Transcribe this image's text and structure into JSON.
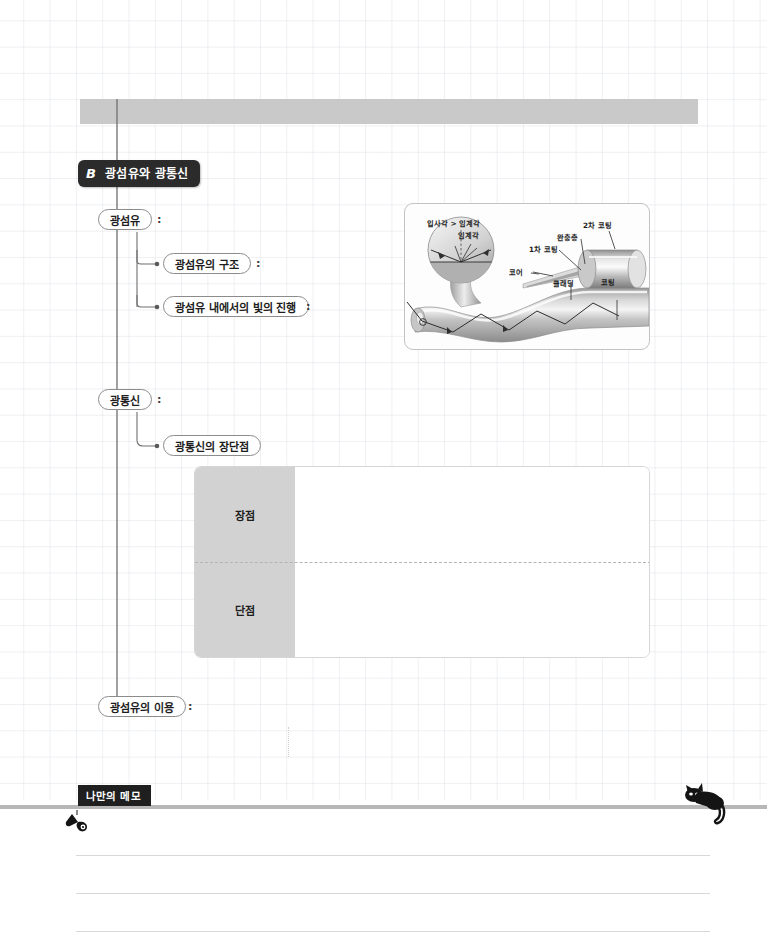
{
  "page": {
    "top_bar_text": "",
    "background": "grid-notebook"
  },
  "section": {
    "letter": "B",
    "title": "광섬유와 광통신",
    "badge_color": "#2b2b2b"
  },
  "mindmap": {
    "nodes": [
      {
        "id": "optical-fiber",
        "label": "광섬유",
        "colon": ":",
        "level": 1
      },
      {
        "id": "fiber-structure",
        "label": "광섬유의 구조",
        "colon": ":",
        "level": 2
      },
      {
        "id": "light-propagation",
        "label": "광섬유 내에서의 빛의 진행",
        "colon": ":",
        "level": 2
      },
      {
        "id": "optical-comm",
        "label": "광통신",
        "colon": ":",
        "level": 1
      },
      {
        "id": "comm-pros-cons",
        "label": "광통신의 장단점",
        "colon": "",
        "level": 2
      },
      {
        "id": "fiber-usage",
        "label": "광섬유의 이용",
        "colon": ":",
        "level": 1
      }
    ]
  },
  "figure": {
    "caption": "",
    "labels": {
      "incidence_gt_critical": "입사각 > 임계각",
      "critical_angle": "임계각",
      "secondary_coating": "2차 코팅",
      "buffer_layer": "완충층",
      "primary_coating": "1차 코팅",
      "core": "코어",
      "cladding": "클래딩",
      "coating": "코팅"
    }
  },
  "pros_cons_table": {
    "rows": [
      {
        "label": "장점",
        "value": ""
      },
      {
        "label": "단점",
        "value": ""
      }
    ],
    "label_bg": "#d2d2d2"
  },
  "memo": {
    "badge_label": "나만의 메모",
    "lines": [
      "",
      "",
      ""
    ]
  },
  "icons": {
    "bird": "bird-icon",
    "cat": "cat-icon"
  }
}
